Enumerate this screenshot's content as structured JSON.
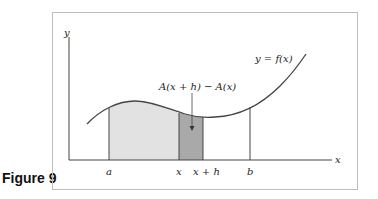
{
  "caption": "Figure 9",
  "axes": {
    "x_label": "x",
    "y_label": "y"
  },
  "curve_label": "y = f(x)",
  "difference_label": "A(x + h) − A(x)",
  "ticks": [
    "a",
    "x",
    "x + h",
    "b"
  ],
  "colors": {
    "frame": "#bdbdbd",
    "axis": "#444444",
    "curve": "#444444",
    "region_light": "#e2e2e2",
    "region_dark": "#a9a9a9"
  }
}
